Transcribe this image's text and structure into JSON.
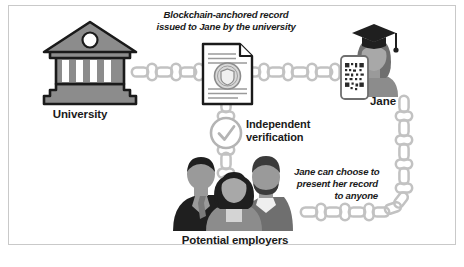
{
  "figure": {
    "background_color": "#ffffff",
    "frame_color": "#c9c9c9",
    "ink_color": "#1a1a1a",
    "chain_color": "#c6c6c6",
    "figure_gray": "#8c8c8c"
  },
  "nodes": {
    "university": {
      "label": "University",
      "icon": "classical-building-icon"
    },
    "record": {
      "caption": "Blockchain-anchored record\nissued to Jane by the university",
      "icon": "document-with-seal-icon"
    },
    "verification": {
      "label": "Independent\nverification",
      "icon": "check-circle-icon"
    },
    "jane": {
      "label": "Jane",
      "icon": "graduate-person-icon",
      "device_icon": "phone-qr-code-icon"
    },
    "employers": {
      "label": "Potential employers",
      "icon": "three-people-icon"
    },
    "sharing": {
      "caption": "Jane can choose to\npresent her record\nto anyone"
    }
  },
  "connectors": {
    "university_to_record": "chain-link-horizontal",
    "record_to_jane": "chain-link-horizontal",
    "record_to_employers": "chain-link-vertical",
    "jane_to_employers": "chain-link-elbow"
  }
}
